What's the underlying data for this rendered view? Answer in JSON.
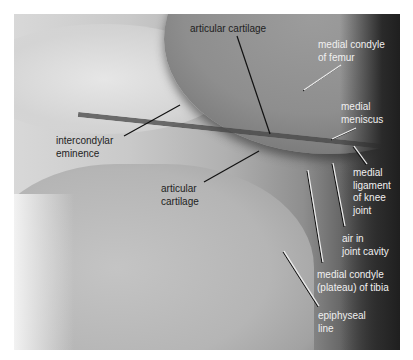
{
  "figure": {
    "type": "knee radiograph (lateral-medial view) with anatomical labels",
    "background_color": "#ffffff",
    "label_colors": {
      "dark": "#1e1e1e",
      "light": "#f0f0f0"
    },
    "labels": [
      {
        "id": "articular-cartilage-top",
        "text": "articular cartilage",
        "x": 190,
        "y": 23,
        "tone": "dark",
        "leader": {
          "x1": 237,
          "y1": 36,
          "x2": 270,
          "y2": 134
        }
      },
      {
        "id": "medial-condyle-of-femur",
        "text": "medial condyle\nof femur",
        "x": 318,
        "y": 39,
        "tone": "light",
        "leader": {
          "x1": 341,
          "y1": 65,
          "x2": 304,
          "y2": 90
        }
      },
      {
        "id": "medial-meniscus",
        "text": "medial\nmeniscus",
        "x": 341,
        "y": 101,
        "tone": "light",
        "leader": {
          "x1": 356,
          "y1": 128,
          "x2": 332,
          "y2": 139
        }
      },
      {
        "id": "intercondylar-eminence",
        "text": "intercondylar\neminence",
        "x": 56,
        "y": 135,
        "tone": "dark",
        "leader": {
          "x1": 124,
          "y1": 136,
          "x2": 180,
          "y2": 105
        }
      },
      {
        "id": "medial-ligament-of-knee-joint",
        "text": "medial\nligament\nof knee\njoint",
        "x": 353,
        "y": 167,
        "tone": "light",
        "leader": {
          "x1": 354,
          "y1": 146,
          "x2": 367,
          "y2": 164
        }
      },
      {
        "id": "articular-cartilage-bottom",
        "text": "articular\ncartilage",
        "x": 161,
        "y": 183,
        "tone": "dark",
        "leader": {
          "x1": 204,
          "y1": 182,
          "x2": 259,
          "y2": 151
        }
      },
      {
        "id": "air-in-joint-cavity",
        "text": "air in\njoint cavity",
        "x": 342,
        "y": 233,
        "tone": "light",
        "leader": {
          "x1": 333,
          "y1": 163,
          "x2": 345,
          "y2": 226
        }
      },
      {
        "id": "medial-condyle-plateau-of-tibia",
        "text": "medial condyle\n(plateau) of tibia",
        "x": 317,
        "y": 269,
        "tone": "light",
        "leader": {
          "x1": 308,
          "y1": 170,
          "x2": 323,
          "y2": 262
        }
      },
      {
        "id": "epiphyseal-line",
        "text": "epiphyseal\nline",
        "x": 318,
        "y": 310,
        "tone": "light",
        "leader": {
          "x1": 284,
          "y1": 251,
          "x2": 319,
          "y2": 306
        }
      }
    ]
  }
}
